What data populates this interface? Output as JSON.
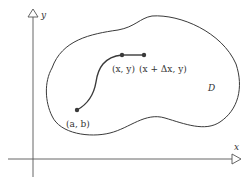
{
  "diagram": {
    "axes": {
      "x_label": "x",
      "y_label": "y"
    },
    "region": {
      "label": "D"
    },
    "points": {
      "start": {
        "label": "(a, b)"
      },
      "current": {
        "label": "(x, y)"
      },
      "next": {
        "label": "(x + Δx, y)"
      }
    },
    "colors": {
      "stroke": "#3a3a3a",
      "axis": "#555555",
      "background": "#ffffff"
    }
  }
}
